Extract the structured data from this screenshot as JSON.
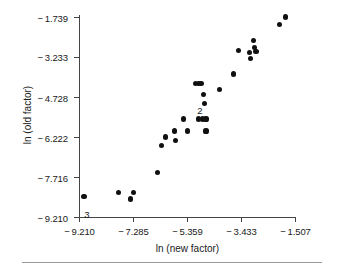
{
  "chart_data": {
    "type": "scatter",
    "title": "",
    "xlabel": "ln (new factor)",
    "ylabel": "ln (old factor)",
    "xlim": [
      -9.21,
      -1.507
    ],
    "ylim": [
      -9.21,
      -1.739
    ],
    "grid": false,
    "legend": null,
    "xticks": [
      "-9.210",
      "-7.285",
      "-5.359",
      "-3.433",
      "-1.507"
    ],
    "xtick_values": [
      -9.21,
      -7.285,
      -5.359,
      -3.433,
      -1.507
    ],
    "yticks": [
      "-1.739",
      "-3.233",
      "-4.728",
      "-6.222",
      "-7.716",
      "-9.210"
    ],
    "ytick_values": [
      -1.739,
      -3.233,
      -4.728,
      -6.222,
      -7.716,
      -9.21
    ],
    "marker": "filled-circle",
    "marker_color": "#101010",
    "points": [
      {
        "x": -9.03,
        "y": -8.43
      },
      {
        "x": -7.8,
        "y": -8.28
      },
      {
        "x": -7.38,
        "y": -8.54
      },
      {
        "x": -7.27,
        "y": -8.28
      },
      {
        "x": -6.42,
        "y": -7.55
      },
      {
        "x": -6.27,
        "y": -6.55
      },
      {
        "x": -6.12,
        "y": -6.22
      },
      {
        "x": -5.8,
        "y": -6.0
      },
      {
        "x": -5.78,
        "y": -6.35
      },
      {
        "x": -5.48,
        "y": -5.55
      },
      {
        "x": -5.33,
        "y": -6.0
      },
      {
        "x": -5.05,
        "y": -4.22
      },
      {
        "x": -4.95,
        "y": -4.22
      },
      {
        "x": -4.86,
        "y": -4.22
      },
      {
        "x": -4.94,
        "y": -5.55
      },
      {
        "x": -4.82,
        "y": -5.55
      },
      {
        "x": -4.78,
        "y": -4.62
      },
      {
        "x": -4.74,
        "y": -4.98
      },
      {
        "x": -4.68,
        "y": -5.55
      },
      {
        "x": -4.68,
        "y": -6.0
      },
      {
        "x": -4.2,
        "y": -4.45
      },
      {
        "x": -3.7,
        "y": -3.87
      },
      {
        "x": -3.52,
        "y": -2.98
      },
      {
        "x": -3.14,
        "y": -3.05
      },
      {
        "x": -3.1,
        "y": -3.28
      },
      {
        "x": -2.98,
        "y": -2.62
      },
      {
        "x": -2.94,
        "y": -2.88
      },
      {
        "x": -2.9,
        "y": -3.02
      },
      {
        "x": -2.06,
        "y": -2.02
      },
      {
        "x": -1.86,
        "y": -1.74
      }
    ],
    "overlap_annotations": [
      {
        "label": "2",
        "x": -4.9,
        "y": -5.23,
        "note": "two coincident points"
      },
      {
        "label": "3",
        "x": -9.21,
        "y": -9.21,
        "note": "three coincident points at origin corner"
      }
    ]
  },
  "axes": {
    "y_title": "ln (old factor)",
    "x_title": "ln (new factor)",
    "y_tick_labels": [
      "-1.739",
      "-3.233",
      "-4.728",
      "-6.222",
      "-7.716",
      "-9.210"
    ],
    "x_tick_labels": [
      "-9.210",
      "-7.285",
      "-5.359",
      "-3.433",
      "-1.507"
    ]
  }
}
